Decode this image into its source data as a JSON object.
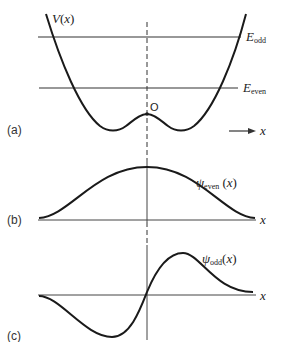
{
  "figure": {
    "panel_a": {
      "label": "(a)",
      "potential_label": "V(x)",
      "potential_label_main": "V",
      "potential_label_arg": "(x)",
      "energy_levels": [
        {
          "name": "E_odd",
          "symbol": "E",
          "subscript": "odd"
        },
        {
          "name": "E_even",
          "symbol": "E",
          "subscript": "even"
        }
      ],
      "origin_label": "O",
      "axis_arrow_label": "x"
    },
    "panel_b": {
      "label": "(b)",
      "curve_label_symbol": "ψ",
      "curve_label_subscript": "even",
      "curve_label_arg": "(x)",
      "axis_label": "x"
    },
    "panel_c": {
      "label": "(c)",
      "curve_label_symbol": "ψ",
      "curve_label_subscript": "odd",
      "curve_label_arg": "(x)",
      "axis_label": "x"
    }
  }
}
